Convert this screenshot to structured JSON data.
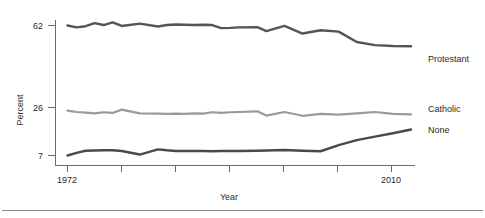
{
  "chart_data": {
    "type": "line",
    "title": "",
    "xlabel": "Year",
    "ylabel": "Percent",
    "xlim": [
      1972,
      2010
    ],
    "ylim": [
      0,
      70
    ],
    "grid": false,
    "legend_position": "right-inline",
    "y_ticks": [
      7,
      26,
      62
    ],
    "y_tick_labels": [
      "7",
      "26",
      "62"
    ],
    "x_ticks": [
      1972,
      1978,
      1984,
      1990,
      1996,
      2002,
      2008
    ],
    "x_tick_labels": [
      "1972",
      "",
      "",
      "",
      "",
      "",
      "2010"
    ],
    "x": [
      1972,
      1973,
      1974,
      1975,
      1976,
      1977,
      1978,
      1980,
      1982,
      1983,
      1984,
      1985,
      1986,
      1987,
      1988,
      1989,
      1990,
      1991,
      1993,
      1994,
      1996,
      1998,
      2000,
      2002,
      2004,
      2006,
      2008,
      2010
    ],
    "series": [
      {
        "name": "Protestant",
        "color": "#555555",
        "values": [
          62.0,
          61.2,
          61.7,
          63.0,
          62.2,
          63.3,
          61.8,
          62.8,
          61.6,
          62.2,
          62.4,
          62.3,
          62.2,
          62.3,
          62.2,
          60.9,
          61.0,
          61.2,
          61.3,
          59.6,
          61.8,
          58.6,
          60.0,
          59.4,
          55.0,
          53.7,
          53.3,
          53.2
        ]
      },
      {
        "name": "Catholic",
        "color": "#9a9a9a",
        "values": [
          26.0,
          25.4,
          25.1,
          24.8,
          25.3,
          25.0,
          26.4,
          24.8,
          24.7,
          24.6,
          24.7,
          24.6,
          24.8,
          24.7,
          25.3,
          25.0,
          25.3,
          25.4,
          25.7,
          23.9,
          25.4,
          23.8,
          24.6,
          24.3,
          24.8,
          25.4,
          24.6,
          24.4
        ]
      },
      {
        "name": "None",
        "color": "#4a4a4a",
        "values": [
          7.0,
          8.1,
          9.0,
          9.1,
          9.2,
          9.2,
          8.9,
          7.4,
          9.6,
          9.2,
          8.9,
          8.9,
          8.9,
          8.9,
          8.8,
          8.9,
          8.9,
          8.9,
          9.0,
          9.1,
          9.3,
          9.0,
          8.8,
          11.4,
          13.5,
          15.0,
          16.4,
          18.0
        ]
      }
    ]
  },
  "labels": {
    "y_axis_title": "Percent",
    "x_axis_title": "Year",
    "x_start": "1972",
    "x_end": "2010",
    "y_top": "62",
    "y_mid": "26",
    "y_bottom": "7",
    "series_protestant": "Protestant",
    "series_catholic": "Catholic",
    "series_none": "None"
  },
  "colors": {
    "protestant": "#555555",
    "catholic": "#9a9a9a",
    "none": "#4a4a4a",
    "axis": "#6b6b6b",
    "text": "#2b2b2b",
    "rule": "#8a8a8a",
    "background": "#ffffff"
  }
}
